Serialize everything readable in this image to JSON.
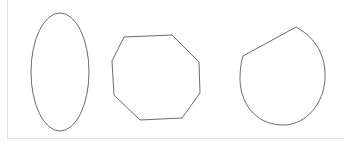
{
  "canvas": {
    "width": 352,
    "height": 148,
    "background_color": "#ffffff",
    "border_color": "#e3e3e6",
    "stroke_color": "#5a5a5a",
    "stroke_width": 0.9,
    "fill": "none"
  },
  "shapes": [
    {
      "name": "ellipse",
      "label": "vertical-ellipse",
      "type": "ellipse",
      "cx": 60,
      "cy": 72,
      "rx": 29,
      "ry": 59
    },
    {
      "name": "octagon",
      "label": "octagon",
      "type": "polygon",
      "sides": 8,
      "points": "124,37 172,35 199,62 200,93 182,118 140,120 114,95 112,61"
    },
    {
      "name": "truncated-circle",
      "label": "circle-with-chord",
      "type": "path",
      "d": "M 243 56 L 296 27 C 316 38 326 56 325 78 C 324 104 306 124 285 125 C 259 126 241 107 240 80 C 240 70 241 62 243 56 Z"
    }
  ]
}
